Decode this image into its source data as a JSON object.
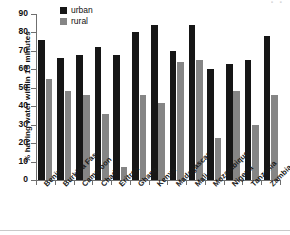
{
  "artifact": {
    "top_right_text": "· ·"
  },
  "axes": {
    "ylabel": "% having water within 15 minutes",
    "yticks": [
      0,
      10,
      20,
      30,
      40,
      50,
      60,
      70,
      80,
      90
    ]
  },
  "legend": {
    "items": [
      {
        "label": "urban",
        "color": "#161616"
      },
      {
        "label": "rural",
        "color": "#858585"
      }
    ]
  },
  "chart_data": {
    "type": "bar",
    "title": "",
    "xlabel": "",
    "ylabel": "% having water within 15 minutes",
    "ylim": [
      0,
      90
    ],
    "grid": false,
    "legend_position": "top-left",
    "categories": [
      "Benin",
      "Burkina Faso",
      "Cameroon",
      "Chad",
      "Eritrea",
      "Ghana",
      "Kenya",
      "Madagascar",
      "Mali",
      "Mozambique",
      "Nigeria",
      "Tanzania",
      "Zambia"
    ],
    "series": [
      {
        "name": "urban",
        "color": "#161616",
        "values": [
          76,
          66,
          68,
          72,
          68,
          80,
          84,
          70,
          84,
          60,
          63,
          65,
          78
        ]
      },
      {
        "name": "rural",
        "color": "#858585",
        "values": [
          55,
          48,
          46,
          36,
          7,
          46,
          42,
          64,
          65,
          23,
          48,
          30,
          46
        ]
      }
    ]
  }
}
